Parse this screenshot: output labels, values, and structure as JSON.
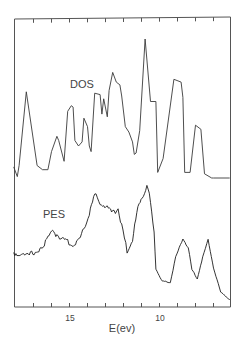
{
  "chart_data": {
    "type": "line",
    "title": "",
    "xlabel": "E(ev)",
    "ylabel": "",
    "x_axis": {
      "reversed": true,
      "range": [
        18.1,
        6.1
      ],
      "tick_values": [
        17,
        16,
        15,
        14,
        13,
        12,
        11,
        10,
        9,
        8,
        7
      ],
      "tick_labels": [
        {
          "value": 15,
          "label": "15"
        },
        {
          "value": 10,
          "label": "10"
        }
      ],
      "ticks_on_top": true
    },
    "y_axis": {
      "shown": false,
      "units": "arbitrary (relative intensity)"
    },
    "grid": false,
    "legend": "inline labels",
    "series": [
      {
        "name": "DOS",
        "description": "Calculated density of states (upper curve), relative intensity 0-1",
        "x": [
          18.1,
          17.9,
          17.8,
          17.4,
          16.8,
          16.5,
          16.2,
          16.0,
          15.7,
          15.6,
          15.3,
          15.1,
          14.9,
          14.8,
          14.7,
          14.5,
          14.3,
          14.2,
          14.0,
          13.9,
          13.8,
          13.6,
          13.3,
          13.2,
          13.1,
          12.9,
          12.8,
          12.6,
          12.4,
          12.2,
          12.1,
          11.9,
          11.7,
          11.5,
          11.4,
          11.3,
          11.1,
          10.8,
          10.5,
          10.2,
          10.1,
          9.8,
          9.2,
          8.8,
          8.7,
          8.6,
          8.3,
          8.0,
          7.7,
          7.5,
          7.1,
          7.0,
          6.1
        ],
        "y": [
          0.08,
          0.01,
          0.09,
          0.62,
          0.09,
          0.06,
          0.06,
          0.19,
          0.3,
          0.27,
          0.12,
          0.48,
          0.52,
          0.51,
          0.27,
          0.23,
          0.26,
          0.43,
          0.37,
          0.23,
          0.19,
          0.61,
          0.6,
          0.46,
          0.57,
          0.44,
          0.63,
          0.76,
          0.69,
          0.67,
          0.59,
          0.37,
          0.33,
          0.26,
          0.17,
          0.18,
          0.34,
          1.0,
          0.55,
          0.55,
          0.04,
          0.14,
          0.71,
          0.69,
          0.58,
          0.04,
          0.04,
          0.38,
          0.35,
          0.03,
          0.0,
          0.0,
          0.0
        ]
      },
      {
        "name": "PES",
        "description": "Measured photoelectron spectrum (lower curve, noisy), relative intensity 0-1",
        "x": [
          18.1,
          17.8,
          17.3,
          16.7,
          16.4,
          16.0,
          15.7,
          15.4,
          15.1,
          14.8,
          14.4,
          14.2,
          13.9,
          13.6,
          13.3,
          12.9,
          12.6,
          12.3,
          12.1,
          11.8,
          11.5,
          11.2,
          10.9,
          10.7,
          10.5,
          10.3,
          10.2,
          9.9,
          9.4,
          9.1,
          8.7,
          8.4,
          8.2,
          7.9,
          7.6,
          7.3,
          7.0,
          6.6,
          6.1
        ],
        "y": [
          0.4,
          0.38,
          0.37,
          0.43,
          0.47,
          0.58,
          0.56,
          0.52,
          0.49,
          0.47,
          0.52,
          0.62,
          0.74,
          0.9,
          0.84,
          0.79,
          0.74,
          0.79,
          0.63,
          0.41,
          0.52,
          0.78,
          0.9,
          0.99,
          0.84,
          0.59,
          0.26,
          0.17,
          0.15,
          0.37,
          0.53,
          0.45,
          0.26,
          0.18,
          0.37,
          0.52,
          0.28,
          0.06,
          0.0
        ]
      }
    ],
    "annotations": [
      {
        "text": "DOS",
        "near": "upper curve"
      },
      {
        "text": "PES",
        "near": "lower curve"
      }
    ]
  },
  "labels": {
    "dos": "DOS",
    "pes": "PES",
    "tick_15": "15",
    "tick_10": "10",
    "xlabel": "E(ev)"
  },
  "colors": {
    "line": "#333333",
    "frame": "#555555",
    "background": "#ffffff"
  }
}
